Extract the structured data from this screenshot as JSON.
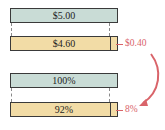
{
  "diagram": {
    "price_comparison": {
      "original_label": "$5.00",
      "new_label": "$4.60",
      "difference_label": "$0.40"
    },
    "percent_comparison": {
      "original_label": "100%",
      "new_label": "92%",
      "difference_label": "8%"
    },
    "colors": {
      "original_bar": "#c9dcd6",
      "new_bar": "#f2dca6",
      "accent": "#d9646a"
    },
    "new_fraction_of_original": 0.92
  }
}
